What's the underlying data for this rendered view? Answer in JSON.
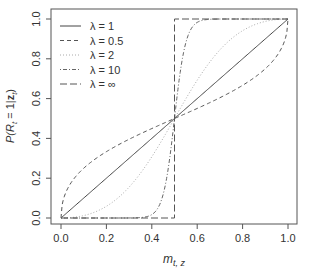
{
  "chart_data": {
    "type": "line",
    "title": "",
    "xlabel": "m_{t,z}",
    "ylabel": "P(R_t = 1|z_t)",
    "xlim": [
      0,
      1
    ],
    "ylim": [
      0,
      1
    ],
    "xticks": [
      "0.0",
      "0.2",
      "0.4",
      "0.6",
      "0.8",
      "1.0"
    ],
    "yticks": [
      "0.0",
      "0.2",
      "0.4",
      "0.6",
      "0.8",
      "1.0"
    ],
    "grid": false,
    "legend_position": "top-left",
    "formula": "P = m^λ / (m^λ + (1-m)^λ)",
    "series": [
      {
        "name": "λ = 1",
        "lambda": 1,
        "style": "solid",
        "color": "#444444",
        "x": [
          0,
          0.1,
          0.2,
          0.3,
          0.4,
          0.5,
          0.6,
          0.7,
          0.8,
          0.9,
          1.0
        ],
        "values": [
          0,
          0.1,
          0.2,
          0.3,
          0.4,
          0.5,
          0.6,
          0.7,
          0.8,
          0.9,
          1.0
        ]
      },
      {
        "name": "λ = 0.5",
        "lambda": 0.5,
        "style": "dashed",
        "color": "#555555",
        "x": [
          0,
          0.1,
          0.2,
          0.3,
          0.4,
          0.5,
          0.6,
          0.7,
          0.8,
          0.9,
          1.0
        ],
        "values": [
          0,
          0.25,
          0.33,
          0.4,
          0.45,
          0.5,
          0.55,
          0.6,
          0.67,
          0.75,
          1.0
        ]
      },
      {
        "name": "λ = 2",
        "lambda": 2,
        "style": "dotted",
        "color": "#aaaaaa",
        "x": [
          0,
          0.1,
          0.2,
          0.3,
          0.4,
          0.5,
          0.6,
          0.7,
          0.8,
          0.9,
          1.0
        ],
        "values": [
          0,
          0.012,
          0.059,
          0.155,
          0.308,
          0.5,
          0.692,
          0.845,
          0.941,
          0.988,
          1.0
        ]
      },
      {
        "name": "λ = 10",
        "lambda": 10,
        "style": "dotdash",
        "color": "#666666",
        "x": [
          0,
          0.1,
          0.2,
          0.3,
          0.4,
          0.5,
          0.6,
          0.7,
          0.8,
          0.9,
          1.0
        ],
        "values": [
          0,
          0.0,
          0.0,
          0.0002,
          0.017,
          0.5,
          0.983,
          0.9998,
          1.0,
          1.0,
          1.0
        ]
      },
      {
        "name": "λ = ∞",
        "lambda": "inf",
        "style": "longdash",
        "color": "#555555",
        "x": [
          0,
          0.5,
          0.5,
          1.0
        ],
        "values": [
          0,
          0,
          1,
          1
        ]
      }
    ]
  },
  "axes": {
    "xlabel_main": "m",
    "xlabel_sub": "t, z",
    "ylabel_prefix": "P(R",
    "ylabel_sub": "t",
    "ylabel_mid": " = 1|",
    "ylabel_bold": "z",
    "ylabel_sub2": "t",
    "ylabel_suffix": ")"
  },
  "legend": {
    "items": [
      {
        "label": "λ = 1"
      },
      {
        "label": "λ = 0.5"
      },
      {
        "label": "λ = 2"
      },
      {
        "label": "λ = 10"
      },
      {
        "label": "λ = ∞"
      }
    ]
  }
}
